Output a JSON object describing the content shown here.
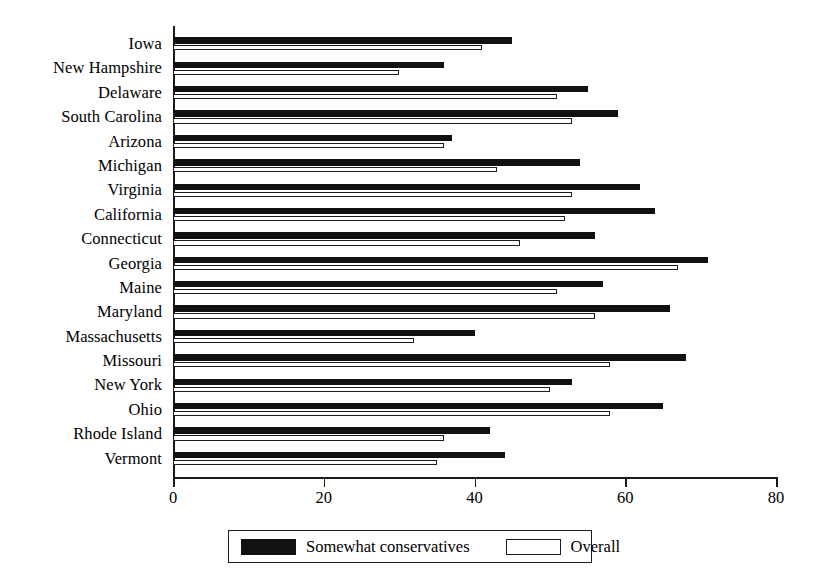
{
  "chart_data": {
    "type": "bar",
    "orientation": "horizontal",
    "title": "",
    "subtitle": "",
    "xlabel": "",
    "ylabel": "",
    "xlim": [
      0,
      80
    ],
    "ylim": null,
    "grid": false,
    "xticks": [
      0,
      20,
      40,
      60,
      80
    ],
    "xtick_labels": [
      "0",
      "20",
      "40",
      "60",
      "80"
    ],
    "legend_position": "bottom-center",
    "categories": [
      "Iowa",
      "New Hampshire",
      "Delaware",
      "South Carolina",
      "Arizona",
      "Michigan",
      "Virginia",
      "California",
      "Connecticut",
      "Georgia",
      "Maine",
      "Maryland",
      "Massachusetts",
      "Missouri",
      "New York",
      "Ohio",
      "Rhode Island",
      "Vermont"
    ],
    "series": [
      {
        "name": "Somewhat conservatives",
        "color": "#111111",
        "style": "filled",
        "values": [
          45,
          36,
          55,
          59,
          37,
          54,
          62,
          64,
          56,
          71,
          57,
          66,
          40,
          68,
          53,
          65,
          42,
          44
        ]
      },
      {
        "name": "Overall",
        "color": "#ffffff",
        "style": "outlined",
        "values": [
          41,
          30,
          51,
          53,
          36,
          43,
          53,
          52,
          46,
          67,
          51,
          56,
          32,
          58,
          50,
          58,
          36,
          35
        ]
      }
    ]
  },
  "legend": {
    "items": [
      {
        "label": "Somewhat conservatives",
        "swatch": "filled-black-swatch"
      },
      {
        "label": "Overall",
        "swatch": "outlined-white-swatch"
      }
    ]
  },
  "axis": {
    "x_tick_labels": [
      "0",
      "20",
      "40",
      "60",
      "80"
    ]
  }
}
